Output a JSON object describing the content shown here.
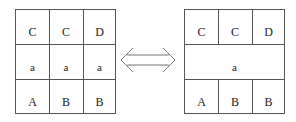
{
  "left_grid": {
    "rows": [
      [
        "C",
        "C",
        "D"
      ],
      [
        "a",
        "a",
        "a"
      ],
      [
        "A",
        "B",
        "B"
      ]
    ]
  },
  "right_grid": {
    "rows": [
      [
        "C",
        "C",
        "D"
      ],
      [
        "a"
      ],
      [
        "A",
        "B",
        "B"
      ]
    ]
  },
  "connector": {
    "icon": "double-arrow-icon"
  }
}
